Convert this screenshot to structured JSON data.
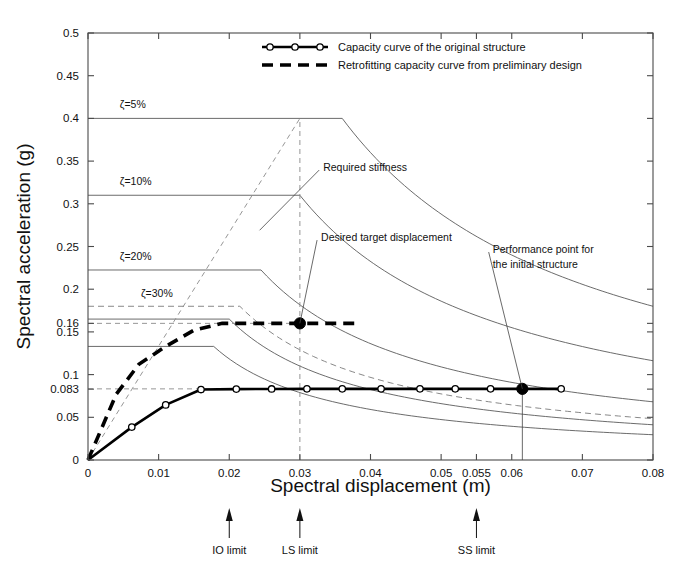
{
  "chart_data": {
    "type": "line",
    "title": "",
    "xlabel": "Spectral displacement (m)",
    "ylabel": "Spectral acceleration (g)",
    "xlim": [
      0,
      0.08
    ],
    "ylim": [
      0,
      0.5
    ],
    "grid": false,
    "xticks": [
      0,
      0.01,
      0.02,
      0.03,
      0.04,
      0.05,
      0.055,
      0.06,
      0.07,
      0.08
    ],
    "xtick_labels": [
      "0",
      "0.01",
      "0.02",
      "0.03",
      "0.04",
      "0.05",
      "0.055",
      "0.06",
      "0.07",
      "0.08"
    ],
    "yticks": [
      0,
      0.05,
      0.083,
      0.1,
      0.15,
      0.16,
      0.2,
      0.25,
      0.3,
      0.35,
      0.4,
      0.45,
      0.5
    ],
    "ytick_labels": [
      "0",
      "0.05",
      "0.083",
      "0.1",
      "0.15",
      "0.16",
      "0.2",
      "0.25",
      "0.3",
      "0.35",
      "0.4",
      "0.45",
      "0.5"
    ],
    "legend": {
      "position": "top-right",
      "entries": [
        {
          "label": "Capacity curve of the original structure",
          "style": "solid-with-circle-markers"
        },
        {
          "label": "Retrofitting capacity curve from preliminary design",
          "style": "thick-dashed"
        }
      ]
    },
    "series": [
      {
        "name": "Capacity curve of the original structure",
        "style": "solid-with-circle-markers",
        "points": [
          [
            0.0,
            0.0
          ],
          [
            0.0062,
            0.0385
          ],
          [
            0.011,
            0.0645
          ],
          [
            0.016,
            0.0825
          ],
          [
            0.021,
            0.083
          ],
          [
            0.026,
            0.0832
          ],
          [
            0.031,
            0.0833
          ],
          [
            0.036,
            0.0833
          ],
          [
            0.0415,
            0.0833
          ],
          [
            0.047,
            0.0833
          ],
          [
            0.052,
            0.0833
          ],
          [
            0.057,
            0.0833
          ],
          [
            0.0615,
            0.0833
          ],
          [
            0.067,
            0.0833
          ]
        ]
      },
      {
        "name": "Retrofitting capacity curve from preliminary design",
        "style": "thick-dashed",
        "points": [
          [
            0.0,
            0.0
          ],
          [
            0.004,
            0.077
          ],
          [
            0.0072,
            0.112
          ],
          [
            0.011,
            0.133
          ],
          [
            0.015,
            0.152
          ],
          [
            0.019,
            0.16
          ],
          [
            0.03,
            0.16
          ],
          [
            0.0378,
            0.16
          ]
        ]
      }
    ],
    "demand_spectra": [
      {
        "name": "zeta-5",
        "label": "ζ=5%",
        "damping": "5%",
        "plateau_acc": 0.4,
        "plateau_end_x": 0.036,
        "corner_start_x": 0.0,
        "style": "solid",
        "label_x": 0.0045,
        "label_y": 0.412
      },
      {
        "name": "zeta-10",
        "label": "ζ=10%",
        "damping": "10%",
        "plateau_acc": 0.31,
        "plateau_end_x": 0.03,
        "corner_start_x": 0.0,
        "style": "solid",
        "label_x": 0.0045,
        "label_y": 0.322
      },
      {
        "name": "zeta-20",
        "label": "ζ=20%",
        "damping": "20%",
        "plateau_acc": 0.2225,
        "plateau_end_x": 0.0245,
        "corner_start_x": 0.0,
        "style": "solid",
        "label_x": 0.0045,
        "label_y": 0.2345
      },
      {
        "name": "zeta-30",
        "label": "ζ=30%",
        "damping": "30%",
        "plateau_acc": 0.18,
        "plateau_end_x": 0.0215,
        "corner_start_x": 0.0,
        "style": "dashed",
        "label_x": 0.0075,
        "label_y": 0.1905
      },
      {
        "name": "spectrum-165",
        "label": "",
        "damping": "",
        "plateau_acc": 0.165,
        "plateau_end_x": 0.02,
        "corner_start_x": 0.0,
        "style": "solid",
        "label_x": 0,
        "label_y": 0
      },
      {
        "name": "spectrum-133",
        "label": "",
        "damping": "",
        "plateau_acc": 0.133,
        "plateau_end_x": 0.0178,
        "corner_start_x": 0.0,
        "style": "solid",
        "label_x": 0,
        "label_y": 0
      }
    ],
    "guides": [
      {
        "name": "required-stiffness-line",
        "type": "diagonal-dashed",
        "from": [
          0.0,
          0.0
        ],
        "to": [
          0.03,
          0.4
        ]
      },
      {
        "name": "target-displacement-vertical",
        "type": "vertical-dashed",
        "x": 0.03,
        "y_from": 0.0,
        "y_to": 0.4
      },
      {
        "name": "retrofit-level-horizontal",
        "type": "horizontal-dashed",
        "y": 0.16,
        "x_from": 0.0,
        "x_to": 0.03
      },
      {
        "name": "initial-level-horizontal",
        "type": "horizontal-dashed",
        "y": 0.0833,
        "x_from": 0.0,
        "x_to": 0.0615
      },
      {
        "name": "performance-point-vertical",
        "type": "vertical-solid",
        "x": 0.0615,
        "y_from": 0.0,
        "y_to": 0.0833
      }
    ],
    "key_points": [
      {
        "name": "desired-target-displacement",
        "x": 0.03,
        "y": 0.16,
        "marker": "filled-circle"
      },
      {
        "name": "performance-point-initial",
        "x": 0.0615,
        "y": 0.0833,
        "marker": "filled-circle"
      }
    ],
    "annotations": [
      {
        "name": "required-stiffness",
        "text": "Required stiffness",
        "text_x": 0.0333,
        "text_y": 0.343,
        "anchor_x": 0.0243,
        "anchor_y": 0.269
      },
      {
        "name": "desired-target-displacement",
        "text": "Desired target displacement",
        "text_x": 0.033,
        "text_y": 0.261,
        "anchor_x": 0.03,
        "anchor_y": 0.16
      },
      {
        "name": "performance-point-initial",
        "text": "Performance point for",
        "text_x": 0.0573,
        "text_y": 0.247,
        "anchor_x": 0.0615,
        "anchor_y": 0.0833
      },
      {
        "name": "performance-point-initial-line2",
        "text": "the initial structure",
        "text_x": 0.0573,
        "text_y": 0.229,
        "anchor_x": 0.0615,
        "anchor_y": 0.0833
      }
    ],
    "limit_markers": [
      {
        "name": "io-limit",
        "label": "IO limit",
        "x": 0.02
      },
      {
        "name": "ls-limit",
        "label": "LS limit",
        "x": 0.03
      },
      {
        "name": "ss-limit",
        "label": "SS limit",
        "x": 0.055
      }
    ],
    "colors": {
      "axis": "#4a4a4a",
      "capacity_curve": "#000000",
      "retrofit_curve": "#000000",
      "spectrum": "#5a5a5a",
      "guide": "#8a8a8a",
      "background": "#ffffff"
    }
  }
}
